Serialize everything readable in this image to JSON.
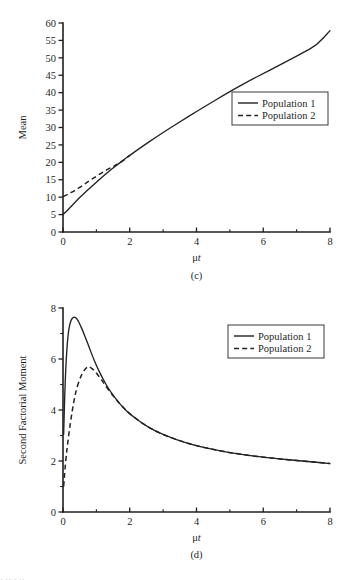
{
  "figure": {
    "panels": [
      {
        "caption": "(c)",
        "ylabel": "Mean",
        "xlabel_mu": "μ",
        "xlabel_t": "t",
        "legend": {
          "entries": [
            {
              "label": "Population 1",
              "style": "solid"
            },
            {
              "label": "Population 2",
              "style": "dashed"
            }
          ]
        }
      },
      {
        "caption": "(d)",
        "ylabel": "Second Factorial Moment",
        "xlabel_mu": "μ",
        "xlabel_t": "t",
        "legend": {
          "entries": [
            {
              "label": "Population 1",
              "style": "solid"
            },
            {
              "label": "Population 2",
              "style": "dashed"
            }
          ]
        }
      }
    ],
    "page_edge_fragment": "· ··  ·   ··"
  },
  "chart_data": [
    {
      "type": "line",
      "title": "",
      "panel": "(c)",
      "xlabel": "μt",
      "ylabel": "Mean",
      "xlim": [
        0,
        8
      ],
      "ylim": [
        0,
        60
      ],
      "xticks": [
        0,
        2,
        4,
        6,
        8
      ],
      "xticklabels": [
        "0",
        "2",
        "4",
        "6",
        "8"
      ],
      "xminorticks": [
        1,
        3,
        5,
        7
      ],
      "yticks": [
        0,
        5,
        10,
        15,
        20,
        25,
        30,
        35,
        40,
        45,
        50,
        55,
        60
      ],
      "yticklabels": [
        "0",
        "5",
        "10",
        "15",
        "20",
        "25",
        "30",
        "35",
        "40",
        "45",
        "50",
        "55",
        "60"
      ],
      "grid": false,
      "legend_position": "center-right",
      "series": [
        {
          "name": "Population 1",
          "style": "solid",
          "x": [
            0,
            0.1,
            0.2,
            0.3,
            0.4,
            0.5,
            0.6,
            0.8,
            1.0,
            1.2,
            1.4,
            1.6,
            1.8,
            2.0,
            2.4,
            2.8,
            3.2,
            3.6,
            4.0,
            4.4,
            4.8,
            5.2,
            5.6,
            6.0,
            6.4,
            6.8,
            7.2,
            7.6,
            8.0
          ],
          "y": [
            5.0,
            5.9,
            6.9,
            7.9,
            8.9,
            9.9,
            10.8,
            12.6,
            14.3,
            16.0,
            17.6,
            19.1,
            20.6,
            22.0,
            24.7,
            27.3,
            29.8,
            32.2,
            34.6,
            36.9,
            39.2,
            41.4,
            43.5,
            45.5,
            47.5,
            49.5,
            51.5,
            53.6,
            57.8
          ]
        },
        {
          "name": "Population 2",
          "style": "dashed",
          "x": [
            0,
            0.1,
            0.2,
            0.3,
            0.4,
            0.5,
            0.6,
            0.7,
            0.8,
            0.9,
            1.0,
            1.1,
            1.2,
            1.3,
            1.4,
            1.5,
            1.6,
            1.8,
            2.0
          ],
          "y": [
            10.2,
            10.6,
            11.1,
            11.6,
            12.2,
            12.8,
            13.4,
            14.1,
            14.8,
            15.4,
            16.0,
            16.6,
            17.2,
            17.8,
            18.3,
            18.8,
            19.3,
            20.4,
            22.0
          ]
        }
      ]
    },
    {
      "type": "line",
      "title": "",
      "panel": "(d)",
      "xlabel": "μt",
      "ylabel": "Second Factorial Moment",
      "xlim": [
        0,
        8
      ],
      "ylim": [
        0,
        8
      ],
      "xticks": [
        0,
        2,
        4,
        6,
        8
      ],
      "xticklabels": [
        "0",
        "2",
        "4",
        "6",
        "8"
      ],
      "xminorticks": [
        1,
        3,
        5,
        7
      ],
      "yticks": [
        0,
        2,
        4,
        6,
        8
      ],
      "yticklabels": [
        "0",
        "2",
        "4",
        "6",
        "8"
      ],
      "yminorticks": [
        1,
        3,
        5,
        7
      ],
      "grid": false,
      "legend_position": "upper-right",
      "series": [
        {
          "name": "Population 1",
          "style": "solid",
          "x": [
            0.02,
            0.05,
            0.1,
            0.15,
            0.2,
            0.25,
            0.3,
            0.35,
            0.4,
            0.45,
            0.5,
            0.6,
            0.7,
            0.8,
            0.9,
            1.0,
            1.2,
            1.4,
            1.6,
            1.8,
            2.0,
            2.4,
            2.8,
            3.2,
            3.6,
            4.0,
            4.5,
            5.0,
            5.5,
            6.0,
            6.5,
            7.0,
            7.5,
            8.0
          ],
          "y": [
            3.05,
            4.6,
            6.1,
            6.95,
            7.35,
            7.55,
            7.63,
            7.64,
            7.6,
            7.5,
            7.38,
            7.08,
            6.75,
            6.4,
            6.06,
            5.75,
            5.2,
            4.76,
            4.4,
            4.1,
            3.85,
            3.45,
            3.15,
            2.93,
            2.75,
            2.6,
            2.45,
            2.33,
            2.23,
            2.15,
            2.08,
            2.02,
            1.96,
            1.9
          ]
        },
        {
          "name": "Population 2",
          "style": "dashed",
          "x": [
            0.02,
            0.05,
            0.1,
            0.15,
            0.2,
            0.25,
            0.3,
            0.35,
            0.4,
            0.5,
            0.6,
            0.7,
            0.75,
            0.8,
            0.9,
            1.0,
            1.1,
            1.2,
            1.4,
            1.6,
            1.8,
            2.0,
            2.4,
            2.8,
            3.2,
            3.6,
            4.0,
            4.5,
            5.0,
            5.5,
            6.0,
            6.5,
            7.0,
            7.5,
            8.0
          ],
          "y": [
            1.0,
            1.55,
            2.25,
            2.8,
            3.3,
            3.75,
            4.15,
            4.5,
            4.8,
            5.22,
            5.5,
            5.66,
            5.7,
            5.69,
            5.6,
            5.45,
            5.28,
            5.1,
            4.72,
            4.4,
            4.1,
            3.85,
            3.45,
            3.15,
            2.93,
            2.75,
            2.6,
            2.45,
            2.33,
            2.23,
            2.15,
            2.08,
            2.02,
            1.96,
            1.9
          ]
        }
      ]
    }
  ]
}
